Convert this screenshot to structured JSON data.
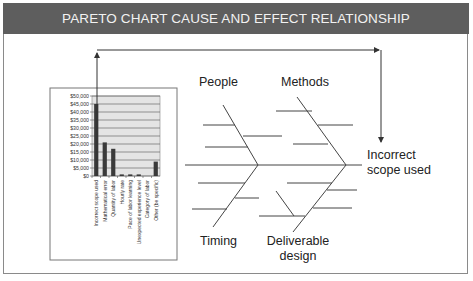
{
  "header": {
    "title": "PARETO CHART CAUSE AND EFFECT RELATIONSHIP"
  },
  "fishbone": {
    "categories": [
      "People",
      "Methods",
      "Timing",
      "Deliverable design"
    ],
    "labels": {
      "people": "People",
      "methods": "Methods",
      "timing": "Timing",
      "deliverable_line1": "Deliverable",
      "deliverable_line2": "design"
    },
    "effect_line1": "Incorrect",
    "effect_line2": "scope used"
  },
  "chart_data": {
    "type": "bar",
    "title": "",
    "xlabel": "",
    "ylabel": "",
    "categories": [
      "Incorrect scope used",
      "Mathematical error",
      "Quantity of labor",
      "Hourly rate",
      "Pace of labor learning",
      "Unexpected experience level",
      "Category of labor",
      "Other (be specific)"
    ],
    "values": [
      45000,
      21000,
      17000,
      1000,
      1000,
      1000,
      0,
      9000
    ],
    "ylim": [
      0,
      50000
    ],
    "yticks": [
      "$50,000",
      "$45,000",
      "$40,000",
      "$35,000",
      "$30,000",
      "$25,000",
      "$20,000",
      "$15,000",
      "$10,000",
      "$5,000",
      "$0"
    ],
    "grid": true,
    "legend": "none"
  },
  "colors": {
    "header_bg": "#5e5e5e",
    "bar": "#3a3a3a",
    "plot_bg": "#e4e4e4",
    "line": "#555555"
  }
}
